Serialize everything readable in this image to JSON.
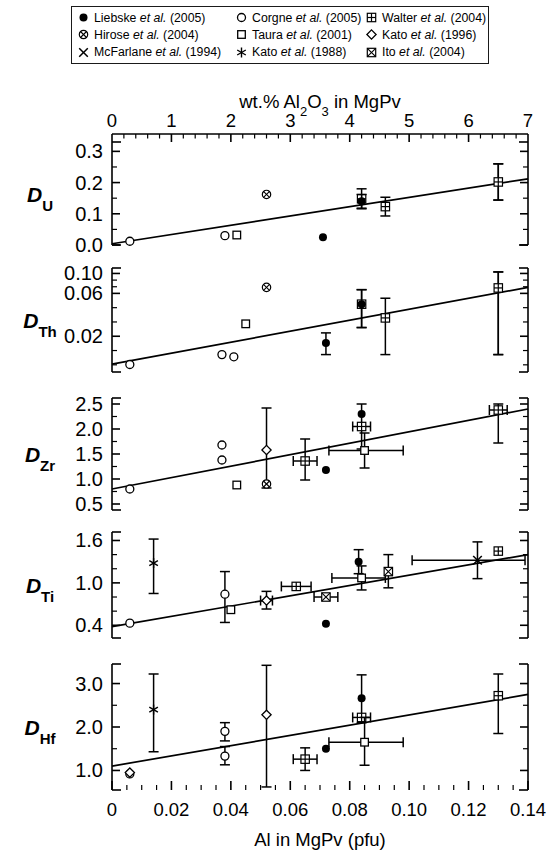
{
  "legend": {
    "items": [
      {
        "symbol": "filled-circle",
        "name": "Liebske",
        "etal": "et al.",
        "year": "(2005)"
      },
      {
        "symbol": "open-circle",
        "name": "Corgne",
        "etal": "et al.",
        "year": "(2005)"
      },
      {
        "symbol": "crossed-square",
        "name": "Walter",
        "etal": "et al.",
        "year": "(2004)"
      },
      {
        "symbol": "crossed-circle",
        "name": "Hirose",
        "etal": "et al.",
        "year": "(2004)"
      },
      {
        "symbol": "open-square",
        "name": "Taura",
        "etal": "et al.",
        "year": "(2001)"
      },
      {
        "symbol": "open-diamond",
        "name": "Kato",
        "etal": "et al.",
        "year": "(1996)"
      },
      {
        "symbol": "x-mark",
        "name": "McFarlane",
        "etal": "et al.",
        "year": "(1994)"
      },
      {
        "symbol": "asterisk",
        "name": "Kato",
        "etal": "et al.",
        "year": "(1988)"
      },
      {
        "symbol": "boxed-x",
        "name": "Ito",
        "etal": "et al.",
        "year": "(2004)"
      }
    ]
  },
  "chart_data": {
    "type": "scatter",
    "title": "",
    "top_axis": {
      "label_parts": [
        "wt.% Al",
        "2",
        "O",
        "3",
        " in MgPv"
      ],
      "label_plain": "wt.% Al2O3 in MgPv",
      "ticks": [
        "0",
        "1",
        "2",
        "3",
        "4",
        "5",
        "6",
        "7"
      ],
      "range": [
        0,
        7
      ],
      "minor_per_major": 5
    },
    "bottom_axis": {
      "label": "Al in MgPv (pfu)",
      "ticks": [
        "0",
        "0.02",
        "0.04",
        "0.06",
        "0.08",
        "0.10",
        "0.12",
        "0.14"
      ],
      "range": [
        0,
        0.14
      ],
      "minor_per_major": 4
    },
    "grid": false,
    "legend_position": "top",
    "panels": [
      {
        "id": "DU",
        "ylabel_main": "D",
        "ylabel_sub": "U",
        "scale": "linear",
        "ylim": [
          0.0,
          0.33
        ],
        "yticks": [
          "0.0",
          "0.1",
          "0.2",
          "0.3"
        ],
        "ytickvals": [
          0.0,
          0.1,
          0.2,
          0.3
        ],
        "minor_per_major": 2,
        "fit_line": {
          "x0": 0.0,
          "y0": 0.004,
          "x1": 0.14,
          "y1": 0.212
        },
        "points": [
          {
            "symbol": "open-circle",
            "x": 0.006,
            "y": 0.012
          },
          {
            "symbol": "open-circle",
            "x": 0.038,
            "y": 0.03
          },
          {
            "symbol": "open-square",
            "x": 0.042,
            "y": 0.032
          },
          {
            "symbol": "crossed-circle",
            "x": 0.052,
            "y": 0.162
          },
          {
            "symbol": "filled-circle",
            "x": 0.071,
            "y": 0.025
          },
          {
            "symbol": "crossed-square",
            "x": 0.084,
            "y": 0.148,
            "yerr": 0.032
          },
          {
            "symbol": "filled-circle",
            "x": 0.084,
            "y": 0.14,
            "yerr": 0.022
          },
          {
            "symbol": "crossed-square",
            "x": 0.092,
            "y": 0.123,
            "yerr": 0.03
          },
          {
            "symbol": "filled-circle",
            "x": 0.13,
            "y": 0.202,
            "yerr": 0.058
          },
          {
            "symbol": "crossed-square",
            "x": 0.13,
            "y": 0.202,
            "yerr": 0.058
          }
        ]
      },
      {
        "id": "DTh",
        "ylabel_main": "D",
        "ylabel_sub": "Th",
        "scale": "log",
        "ylim": [
          0.008,
          0.115
        ],
        "yticks": [
          "0.10",
          "0.06",
          "0.02"
        ],
        "ytickvals": [
          0.1,
          0.06,
          0.02
        ],
        "minor_per_major": 3,
        "fit_line": {
          "x0": 0.0,
          "y0": 0.0098,
          "x1": 0.14,
          "y1": 0.07
        },
        "points": [
          {
            "symbol": "open-circle",
            "x": 0.006,
            "y": 0.0097
          },
          {
            "symbol": "open-circle",
            "x": 0.037,
            "y": 0.0125
          },
          {
            "symbol": "open-circle",
            "x": 0.041,
            "y": 0.0118
          },
          {
            "symbol": "open-square",
            "x": 0.045,
            "y": 0.0275
          },
          {
            "symbol": "crossed-circle",
            "x": 0.052,
            "y": 0.07
          },
          {
            "symbol": "filled-circle",
            "x": 0.072,
            "y": 0.0168,
            "yerrlo": 0.0125,
            "yerrhi": 0.0218
          },
          {
            "symbol": "crossed-square",
            "x": 0.084,
            "y": 0.0455,
            "yerrlo": 0.025,
            "yerrhi": 0.066
          },
          {
            "symbol": "filled-circle",
            "x": 0.084,
            "y": 0.0455,
            "yerrlo": 0.025,
            "yerrhi": 0.066
          },
          {
            "symbol": "crossed-square",
            "x": 0.092,
            "y": 0.032,
            "yerrlo": 0.0125,
            "yerrhi": 0.053
          },
          {
            "symbol": "filled-circle",
            "x": 0.13,
            "y": 0.069,
            "yerrlo": 0.0125,
            "yerrhi": 0.104
          },
          {
            "symbol": "crossed-square",
            "x": 0.13,
            "y": 0.069,
            "yerrlo": 0.0125,
            "yerrhi": 0.104
          }
        ]
      },
      {
        "id": "DZr",
        "ylabel_main": "D",
        "ylabel_sub": "Zr",
        "scale": "linear",
        "ylim": [
          0.38,
          2.62
        ],
        "yticks": [
          "2.5",
          "2.0",
          "1.5",
          "1.0",
          "0.5"
        ],
        "ytickvals": [
          2.5,
          2.0,
          1.5,
          1.0,
          0.5
        ],
        "minor_per_major": 2,
        "fit_line": {
          "x0": 0.0,
          "y0": 0.8,
          "x1": 0.14,
          "y1": 2.4
        },
        "points": [
          {
            "symbol": "open-circle",
            "x": 0.006,
            "y": 0.8
          },
          {
            "symbol": "open-circle",
            "x": 0.037,
            "y": 1.68
          },
          {
            "symbol": "open-circle",
            "x": 0.037,
            "y": 1.38
          },
          {
            "symbol": "open-square",
            "x": 0.042,
            "y": 0.88
          },
          {
            "symbol": "open-diamond",
            "x": 0.052,
            "y": 1.58,
            "yerrlo": 0.82,
            "yerrhi": 2.42
          },
          {
            "symbol": "crossed-circle",
            "x": 0.052,
            "y": 0.9
          },
          {
            "symbol": "crossed-square",
            "x": 0.065,
            "y": 1.36,
            "yerrlo": 0.98,
            "yerrhi": 1.8,
            "xerr": 0.004
          },
          {
            "symbol": "filled-circle",
            "x": 0.072,
            "y": 1.18
          },
          {
            "symbol": "filled-circle",
            "x": 0.084,
            "y": 2.3,
            "yerrlo": 1.6,
            "yerrhi": 2.5
          },
          {
            "symbol": "filled-circle",
            "x": 0.084,
            "y": 2.05
          },
          {
            "symbol": "crossed-square",
            "x": 0.084,
            "y": 2.05,
            "xerr": 0.003
          },
          {
            "symbol": "open-square",
            "x": 0.085,
            "y": 1.57,
            "yerrlo": 1.22,
            "yerrhi": 1.92,
            "xerrlo": 0.073,
            "xerrhi": 0.098
          },
          {
            "symbol": "filled-circle",
            "x": 0.13,
            "y": 2.38,
            "yerrlo": 1.72,
            "yerrhi": 2.5
          },
          {
            "symbol": "crossed-square",
            "x": 0.13,
            "y": 2.38,
            "xerr": 0.003
          }
        ]
      },
      {
        "id": "DTi",
        "ylabel_main": "D",
        "ylabel_sub": "Ti",
        "scale": "linear",
        "ylim": [
          0.22,
          1.72
        ],
        "yticks": [
          "1.6",
          "1.0",
          "0.4"
        ],
        "ytickvals": [
          1.6,
          1.0,
          0.4
        ],
        "minor_per_major": 3,
        "fit_line": {
          "x0": 0.0,
          "y0": 0.38,
          "x1": 0.14,
          "y1": 1.4
        },
        "points": [
          {
            "symbol": "open-circle",
            "x": 0.006,
            "y": 0.43
          },
          {
            "symbol": "asterisk",
            "x": 0.014,
            "y": 1.28,
            "yerrlo": 0.85,
            "yerrhi": 1.62
          },
          {
            "symbol": "open-circle",
            "x": 0.038,
            "y": 0.84,
            "yerrlo": 0.44,
            "yerrhi": 1.16
          },
          {
            "symbol": "open-square",
            "x": 0.04,
            "y": 0.62
          },
          {
            "symbol": "open-diamond",
            "x": 0.052,
            "y": 0.75,
            "yerrlo": 0.63,
            "yerrhi": 0.88,
            "xerr": 0.002
          },
          {
            "symbol": "crossed-square",
            "x": 0.062,
            "y": 0.95,
            "xerr": 0.005
          },
          {
            "symbol": "boxed-x",
            "x": 0.072,
            "y": 0.8,
            "xerr": 0.004
          },
          {
            "symbol": "filled-circle",
            "x": 0.072,
            "y": 0.42
          },
          {
            "symbol": "filled-circle",
            "x": 0.083,
            "y": 1.3,
            "yerrlo": 1.13,
            "yerrhi": 1.47
          },
          {
            "symbol": "open-square",
            "x": 0.084,
            "y": 1.07,
            "yerrlo": 0.9,
            "yerrhi": 1.24,
            "xerrlo": 0.074,
            "xerrhi": 0.092
          },
          {
            "symbol": "boxed-x",
            "x": 0.093,
            "y": 1.16,
            "yerrlo": 0.93,
            "yerrhi": 1.4
          },
          {
            "symbol": "x-mark",
            "x": 0.123,
            "y": 1.32,
            "yerrlo": 1.06,
            "yerrhi": 1.58,
            "xerrlo": 0.101,
            "xerrhi": 0.139
          },
          {
            "symbol": "filled-circle",
            "x": 0.13,
            "y": 1.45
          },
          {
            "symbol": "crossed-square",
            "x": 0.13,
            "y": 1.45
          }
        ]
      },
      {
        "id": "DHf",
        "ylabel_main": "D",
        "ylabel_sub": "Hf",
        "scale": "linear",
        "ylim": [
          0.55,
          3.45
        ],
        "yticks": [
          "3.0",
          "2.0",
          "1.0"
        ],
        "ytickvals": [
          3.0,
          2.0,
          1.0
        ],
        "minor_per_major": 2,
        "fit_line": {
          "x0": 0.0,
          "y0": 1.1,
          "x1": 0.14,
          "y1": 2.75
        },
        "points": [
          {
            "symbol": "open-circle",
            "x": 0.006,
            "y": 0.92
          },
          {
            "symbol": "open-diamond",
            "x": 0.006,
            "y": 0.95
          },
          {
            "symbol": "asterisk",
            "x": 0.014,
            "y": 2.4,
            "yerrlo": 1.43,
            "yerrhi": 3.22
          },
          {
            "symbol": "open-circle",
            "x": 0.038,
            "y": 1.9,
            "yerrlo": 1.68,
            "yerrhi": 2.1
          },
          {
            "symbol": "open-circle",
            "x": 0.038,
            "y": 1.33,
            "yerrlo": 1.13,
            "yerrhi": 1.55
          },
          {
            "symbol": "open-diamond",
            "x": 0.052,
            "y": 2.28,
            "yerrlo": 0.62,
            "yerrhi": 3.42
          },
          {
            "symbol": "crossed-square",
            "x": 0.065,
            "y": 1.26,
            "yerrlo": 1.0,
            "yerrhi": 1.52,
            "xerr": 0.004
          },
          {
            "symbol": "filled-circle",
            "x": 0.072,
            "y": 1.5
          },
          {
            "symbol": "filled-circle",
            "x": 0.084,
            "y": 2.66,
            "yerrlo": 2.1,
            "yerrhi": 3.2
          },
          {
            "symbol": "crossed-square",
            "x": 0.084,
            "y": 2.22,
            "xerr": 0.003
          },
          {
            "symbol": "open-square",
            "x": 0.085,
            "y": 1.65,
            "yerrlo": 1.12,
            "yerrhi": 2.22,
            "xerrlo": 0.073,
            "xerrhi": 0.098
          },
          {
            "symbol": "filled-circle",
            "x": 0.13,
            "y": 2.72,
            "yerrlo": 1.85,
            "yerrhi": 3.22
          },
          {
            "symbol": "crossed-square",
            "x": 0.13,
            "y": 2.72
          }
        ]
      }
    ]
  }
}
